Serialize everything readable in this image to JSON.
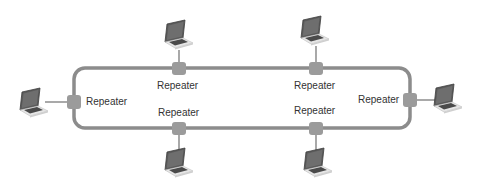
{
  "diagram": {
    "type": "bus-ring-network",
    "colors": {
      "ring": "#8c8c8c",
      "repeater": "#9b9b9b",
      "link": "#7a7a7a",
      "label": "#333333",
      "laptop_screen": "#555555",
      "laptop_body": "#d9d9d9"
    },
    "repeaters": [
      {
        "id": "top-left",
        "label": "Repeater"
      },
      {
        "id": "top-right",
        "label": "Repeater"
      },
      {
        "id": "bottom-left",
        "label": "Repeater"
      },
      {
        "id": "bottom-right",
        "label": "Repeater"
      },
      {
        "id": "left",
        "label": "Repeater"
      },
      {
        "id": "right",
        "label": "Repeater"
      }
    ],
    "laptops": [
      {
        "id": "laptop-top-left",
        "icon": "laptop-icon"
      },
      {
        "id": "laptop-top-right",
        "icon": "laptop-icon"
      },
      {
        "id": "laptop-bottom-left",
        "icon": "laptop-icon"
      },
      {
        "id": "laptop-bottom-right",
        "icon": "laptop-icon"
      },
      {
        "id": "laptop-left",
        "icon": "laptop-icon"
      },
      {
        "id": "laptop-right",
        "icon": "laptop-icon"
      }
    ]
  }
}
